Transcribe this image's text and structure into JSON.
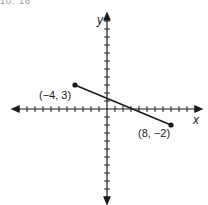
{
  "header": {
    "fragment_text": "10. 16"
  },
  "chart_data": {
    "type": "line",
    "title": "",
    "xlabel": "x",
    "ylabel": "y",
    "xlim": [
      -11,
      11
    ],
    "ylim": [
      -11,
      11
    ],
    "grid": false,
    "tick_step": 1,
    "segment": {
      "points": [
        {
          "x": -4,
          "y": 3,
          "label": "(−4, 3)"
        },
        {
          "x": 8,
          "y": -2,
          "label": "(8, −2)"
        }
      ]
    }
  },
  "labels": {
    "x_axis": "x",
    "y_axis": "y",
    "point_a": "(−4, 3)",
    "point_b": "(8, −2)"
  },
  "colors": {
    "axis": "#1a1a1a",
    "segment": "#1a1a1a",
    "background": "#ffffff"
  }
}
